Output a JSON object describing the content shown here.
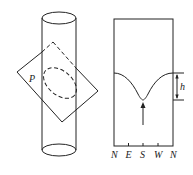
{
  "figure": {
    "left_panel": {
      "plane_label": "P",
      "description": "Inclined plane cutting a vertical cylinder; intersection shown as dashed ellipse"
    },
    "right_panel": {
      "height_label": "h",
      "x_tick_labels": [
        "N",
        "E",
        "S",
        "W",
        "N"
      ],
      "curve_minimum_at": "S",
      "arrow_points_to": "S"
    }
  }
}
